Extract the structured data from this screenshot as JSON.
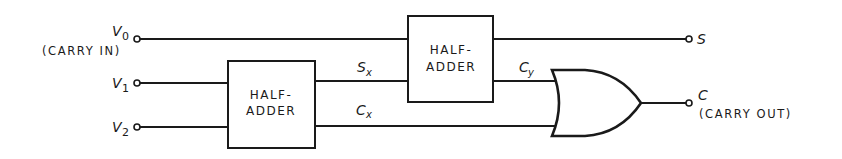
{
  "diagram": {
    "inputs": [
      {
        "id": "v0",
        "symbol": "V",
        "subscript": "0",
        "note": "(CARRY IN)"
      },
      {
        "id": "v1",
        "symbol": "V",
        "subscript": "1",
        "note": ""
      },
      {
        "id": "v2",
        "symbol": "V",
        "subscript": "2",
        "note": ""
      }
    ],
    "blocks": [
      {
        "id": "half-adder-1",
        "line1": "HALF-",
        "line2": "ADDER"
      },
      {
        "id": "half-adder-2",
        "line1": "HALF-",
        "line2": "ADDER"
      }
    ],
    "gates": [
      {
        "id": "or-gate",
        "type": "OR"
      }
    ],
    "signals": [
      {
        "id": "sx",
        "symbol": "S",
        "subscript": "x"
      },
      {
        "id": "cx",
        "symbol": "C",
        "subscript": "x"
      },
      {
        "id": "cy",
        "symbol": "C",
        "subscript": "y"
      }
    ],
    "outputs": [
      {
        "id": "s",
        "symbol": "S",
        "note": ""
      },
      {
        "id": "c",
        "symbol": "C",
        "note": "(CARRY OUT)"
      }
    ],
    "colors": {
      "ink": "#1a1a1a",
      "background": "#ffffff"
    }
  }
}
